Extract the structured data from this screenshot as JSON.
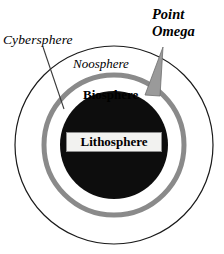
{
  "diagram": {
    "background_color": "#ffffff",
    "labels": {
      "cybersphere": "Cybersphere",
      "noosphere": "Noosphere",
      "biosphere": "Biosphere",
      "lithosphere": "Lithosphere",
      "point_omega_line1": "Point",
      "point_omega_line2": "Omega"
    },
    "shapes": {
      "outer_circle": {
        "name": "cybersphere-boundary",
        "cx": 114,
        "cy": 145,
        "r": 99,
        "stroke": "#1a1a1a",
        "stroke_width": 1.2,
        "fill": "none"
      },
      "middle_ring": {
        "name": "biosphere-ring",
        "cx": 114,
        "cy": 145,
        "r": 70,
        "stroke": "#8a8a8a",
        "stroke_width": 5,
        "fill": "none"
      },
      "inner_disc": {
        "name": "lithosphere-disc",
        "cx": 114,
        "cy": 145,
        "r": 54,
        "fill": "#0d0d0d"
      },
      "leader_line": {
        "name": "cybersphere-leader-line",
        "x1": 43,
        "y1": 47,
        "x2": 64,
        "y2": 109,
        "stroke": "#3a3a3a",
        "stroke_width": 1.1
      },
      "omega_wedge": {
        "name": "point-omega-wedge",
        "points": "163,47 145,95 160,96",
        "fill": "#9a9a9a",
        "stroke": "#6e6e6e",
        "stroke_width": 0.8
      }
    },
    "colors": {
      "ink": "#000000",
      "ring_gray": "#8a8a8a",
      "disc_black": "#0d0d0d",
      "wedge_gray": "#9a9a9a",
      "box_fill": "#f2f2f0",
      "box_border": "#8c8c8c"
    }
  }
}
